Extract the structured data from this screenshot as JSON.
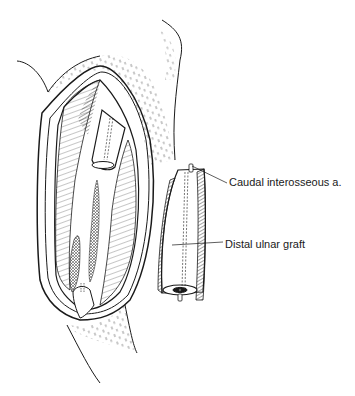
{
  "figure": {
    "type": "surgical-illustration",
    "colors": {
      "ink": "#1a1a1a",
      "background": "#ffffff"
    },
    "labels": [
      {
        "id": "artery",
        "text": "Caudal interosseous a."
      },
      {
        "id": "graft",
        "text": "Distal ulnar graft"
      }
    ]
  }
}
